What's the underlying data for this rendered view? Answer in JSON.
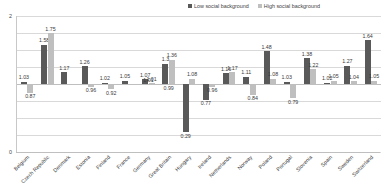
{
  "chart_data": {
    "type": "bar",
    "title": "",
    "xlabel": "",
    "ylabel": "",
    "ylim": [
      0,
      2
    ],
    "yticks": [
      0,
      2
    ],
    "ytick_labels": [
      "0",
      "2"
    ],
    "gridlines": 8,
    "grid": true,
    "legend_position": "top-right",
    "baseline": 1,
    "categories": [
      "Belgium",
      "Czech Republic",
      "Denmark",
      "Estonia",
      "Finland",
      "France",
      "Germany",
      "Great Britain",
      "Hungary",
      "Ireland",
      "Netherlands",
      "Norway",
      "Poland",
      "Portugal",
      "Slovenia",
      "Spain",
      "Sweden",
      "Switzerland"
    ],
    "series": [
      {
        "name": "Low social background",
        "color": "#595959",
        "values": [
          1.03,
          1.58,
          1.17,
          1.26,
          1.02,
          1.05,
          1.07,
          1.3,
          0.29,
          0.77,
          1.16,
          1.11,
          1.48,
          1.03,
          1.38,
          1.02,
          1.27,
          1.64
        ]
      },
      {
        "name": "High social background",
        "color": "#bfbfbf",
        "values": [
          0.87,
          1.75,
          1.0,
          0.96,
          0.92,
          1.0,
          1.01,
          1.36,
          1.08,
          0.96,
          1.17,
          0.84,
          1.08,
          0.79,
          1.22,
          1.05,
          1.04,
          1.05
        ]
      }
    ],
    "data_labels": {
      "low": [
        "1.03",
        "1.58",
        "1.17",
        "1.26",
        "1.02",
        "1.05",
        "1.07",
        "1.3",
        "0.29",
        "0.77",
        "1.16",
        "1.11",
        "1.48",
        "1.03",
        "1.38",
        "1.02",
        "1.27",
        "1.64"
      ],
      "high": [
        "0.87",
        "1.75",
        "",
        "0.96",
        "0.92",
        "",
        "1.01",
        "1.36",
        "1.08",
        "0.96",
        "1.17",
        "0.84",
        "1.08",
        "0.79",
        "1.22",
        "1.05",
        "1.04",
        "1.05"
      ]
    },
    "extra_labels": {
      "great_britain_center": "1.01",
      "hungary_center": "0.99"
    }
  },
  "legend": {
    "low_label": "Low social background",
    "high_label": "High social background"
  }
}
